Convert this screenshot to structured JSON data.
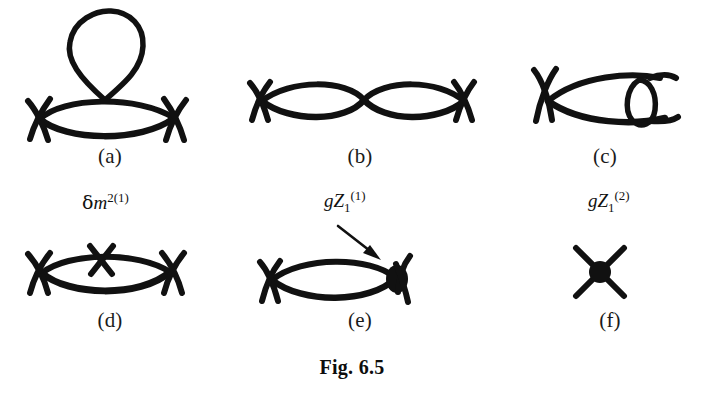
{
  "figure": {
    "caption": "Fig. 6.5",
    "background_color": "#ffffff",
    "ink_color": "#111111"
  },
  "panels": [
    {
      "id": "a",
      "caption": "(a)",
      "description": "tadpole loop on a one-loop bubble with four external legs",
      "annotation": null
    },
    {
      "id": "b",
      "caption": "(b)",
      "description": "double bubble chain with external legs at both ends",
      "annotation": null
    },
    {
      "id": "c",
      "caption": "(c)",
      "description": "bubble with a nested vertical loop at the right vertex",
      "annotation": null
    },
    {
      "id": "d",
      "caption": "(d)",
      "description": "bubble with mass counterterm cross insertion on the upper line",
      "annotation": {
        "base": "m",
        "prefix": "δ",
        "superscript": "2(1)",
        "subscript": "",
        "text": "δm2(1)"
      }
    },
    {
      "id": "e",
      "caption": "(e)",
      "description": "bubble with vertex counterterm blob at the right vertex, arrow pointing to blob",
      "annotation": {
        "base": "Z",
        "prefix": "g",
        "superscript": "(1)",
        "subscript": "1",
        "text": "gZ1(1)"
      }
    },
    {
      "id": "f",
      "caption": "(f)",
      "description": "four point vertex counterterm blob",
      "annotation": {
        "base": "Z",
        "prefix": "g",
        "superscript": "(2)",
        "subscript": "1",
        "text": "gZ1(2)"
      }
    }
  ]
}
